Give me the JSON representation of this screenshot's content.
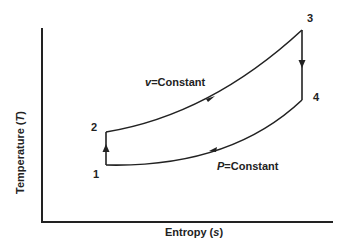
{
  "diagram": {
    "type": "T-s diagram (thermodynamic cycle)",
    "axes": {
      "x_label": {
        "text": "Entropy (",
        "var": "s",
        "close": ")"
      },
      "y_label": {
        "text": "Temperature (",
        "var": "T",
        "close": ")"
      }
    },
    "points": [
      {
        "id": "1",
        "label": "1"
      },
      {
        "id": "2",
        "label": "2"
      },
      {
        "id": "3",
        "label": "3"
      },
      {
        "id": "4",
        "label": "4"
      }
    ],
    "processes": [
      {
        "from": "1",
        "to": "2",
        "kind": "vertical (isentropic)",
        "direction": "up"
      },
      {
        "from": "2",
        "to": "3",
        "kind": "constant volume",
        "label_var": "v",
        "label_text": "=Constant",
        "direction": "right"
      },
      {
        "from": "3",
        "to": "4",
        "kind": "vertical (isentropic)",
        "direction": "down"
      },
      {
        "from": "4",
        "to": "1",
        "kind": "constant pressure",
        "label_var": "P",
        "label_text": "=Constant",
        "direction": "left"
      }
    ],
    "colors": {
      "line": "#222222",
      "background": "#ffffff"
    }
  }
}
